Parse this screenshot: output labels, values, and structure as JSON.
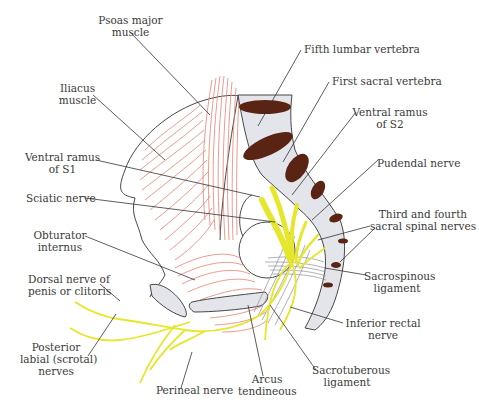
{
  "figure": {
    "type": "anatomical illustration",
    "colors": {
      "muscle_fibers": "#e8806e",
      "bone_fill": "#e4e5ea",
      "vertebral_disc": "#5a2414",
      "nerve": "#e6e62a",
      "outline": "#333333",
      "leader_line": "#333333",
      "label_text": "#3a3a3a"
    }
  },
  "labels": {
    "psoas": {
      "line1": "Psoas major",
      "line2": "muscle"
    },
    "iliacus": {
      "line1": "Iliacus",
      "line2": "muscle"
    },
    "ventral_s1": {
      "line1": "Ventral ramus",
      "line2": "of S1"
    },
    "sciatic": {
      "line1": "Sciatic nerve"
    },
    "obturator": {
      "line1": "Obturator",
      "line2": "internus"
    },
    "dorsal_nerve": {
      "line1": "Dorsal nerve of",
      "line2": "penis or clitoris"
    },
    "posterior_labial": {
      "line1": "Posterior",
      "line2": "labial (scrotal)",
      "line3": "nerves"
    },
    "perineal": {
      "line1": "Perineal nerve"
    },
    "arcus": {
      "line1": "Arcus",
      "line2": "tendineous"
    },
    "sacrotuberous": {
      "line1": "Sacrotuberous",
      "line2": "ligament"
    },
    "inferior_rectal": {
      "line1": "Inferior rectal",
      "line2": "nerve"
    },
    "sacrospinous": {
      "line1": "Sacrospinous",
      "line2": "ligament"
    },
    "third_fourth": {
      "line1": "Third and fourth",
      "line2": "sacral spinal nerves"
    },
    "pudendal": {
      "line1": "Pudendal nerve"
    },
    "ventral_s2": {
      "line1": "Ventral ramus",
      "line2": "of S2"
    },
    "first_sacral": {
      "line1": "First sacral vertebra"
    },
    "fifth_lumbar": {
      "line1": "Fifth lumbar vertebra"
    }
  }
}
